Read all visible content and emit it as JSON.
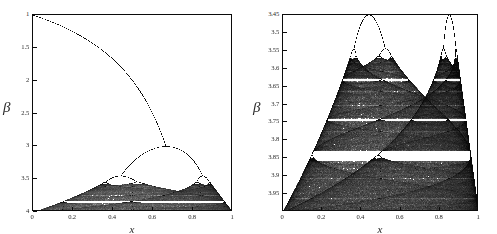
{
  "figure": {
    "width": 497,
    "height": 234,
    "background": "#ffffff",
    "ink": "#0b0b0b"
  },
  "chart_data": [
    {
      "id": "left",
      "type": "scatter",
      "title": "",
      "subtitle": "",
      "description": "Bifurcation diagram of the logistic map x -> beta*x*(1-x), attractor x plotted horizontally against control parameter beta plotted downward. Full parameter range showing the single fixed-point branch, the period-doubling cascade and the chaotic band.",
      "xlabel": "x",
      "ylabel": "β",
      "xlim": [
        0,
        1
      ],
      "ylim": [
        1,
        4
      ],
      "y_axis_direction": "increasing-downward",
      "grid": false,
      "legend": null,
      "xticks": [
        0,
        0.2,
        0.4,
        0.6,
        0.8,
        1
      ],
      "xticklabels": [
        "0",
        "0.2",
        "0.4",
        "0.6",
        "0.8",
        "1"
      ],
      "yticks": [
        1,
        1.5,
        2,
        2.5,
        3,
        3.5,
        4
      ],
      "yticklabels": [
        "1",
        "1.5",
        "2",
        "2.5",
        "3",
        "3.5",
        "4"
      ],
      "map": "logistic",
      "map_formula": "x_{n+1} = beta * x_n * (1 - x_n)",
      "point_color": "#0b0b0b",
      "annotations": [
        {
          "label": "fixed point branch starts",
          "x": 0.0,
          "beta": 1.0
        },
        {
          "label": "first period doubling",
          "x": 0.667,
          "beta": 3.0
        },
        {
          "label": "second period doubling",
          "x": 0.44,
          "beta": 3.449
        },
        {
          "label": "second period doubling",
          "x": 0.85,
          "beta": 3.449
        },
        {
          "label": "accumulation / onset of chaos",
          "x": 0.5,
          "beta": 3.57
        }
      ],
      "frame": {
        "left": 32,
        "top": 14,
        "width": 200,
        "height": 197
      }
    },
    {
      "id": "right",
      "type": "scatter",
      "title": "",
      "subtitle": "",
      "description": "Magnified view of the chaotic region of the same logistic-map bifurcation diagram, showing the two period-2 bands, their period-doubling cascades, band merging near beta = 3.68 and the bright periodic windows (notably the period-3 window near beta = 3.83).",
      "xlabel": "x",
      "ylabel": "β",
      "xlim": [
        0,
        1
      ],
      "ylim": [
        3.45,
        4.0
      ],
      "y_axis_direction": "increasing-downward",
      "grid": false,
      "legend": null,
      "xticks": [
        0,
        0.2,
        0.4,
        0.6,
        0.8,
        1
      ],
      "xticklabels": [
        "0",
        "0.2",
        "0.4",
        "0.6",
        "0.8",
        "1"
      ],
      "yticks": [
        3.45,
        3.5,
        3.55,
        3.6,
        3.65,
        3.7,
        3.75,
        3.8,
        3.85,
        3.9,
        3.95
      ],
      "yticklabels": [
        "3.45",
        "3.5",
        "3.55",
        "3.6",
        "3.65",
        "3.7",
        "3.75",
        "3.8",
        "3.85",
        "3.9",
        "3.95"
      ],
      "map": "logistic",
      "map_formula": "x_{n+1} = beta * x_n * (1 - x_n)",
      "point_color": "#0b0b0b",
      "annotations": [
        {
          "label": "period-4 doubling left branch",
          "x": 0.43,
          "beta": 3.449
        },
        {
          "label": "period-4 doubling right branch",
          "x": 0.845,
          "beta": 3.449
        },
        {
          "label": "band merging",
          "x": 0.5,
          "beta": 3.679
        },
        {
          "label": "period-3 window",
          "x": 0.5,
          "beta": 3.832
        }
      ],
      "frame": {
        "left": 282,
        "top": 14,
        "width": 196,
        "height": 197
      }
    }
  ],
  "render": {
    "beta_steps": 1100,
    "transient_iterations": 260,
    "plot_iterations": 260,
    "seeds": 3
  }
}
